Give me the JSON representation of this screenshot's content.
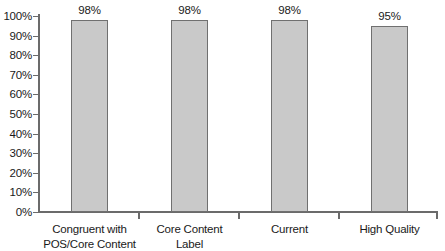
{
  "chart_data": {
    "type": "bar",
    "title": "",
    "subtitle": "",
    "xlabel": "",
    "ylabel": "",
    "categories": [
      "Congruent with POS/Core Content",
      "Core Content Label",
      "Current",
      "High Quality"
    ],
    "category_lines": [
      [
        "Congruent with",
        "POS/Core Content"
      ],
      [
        "Core Content",
        "Label"
      ],
      [
        "Current"
      ],
      [
        "High Quality"
      ]
    ],
    "values": [
      98,
      98,
      98,
      95
    ],
    "value_labels": [
      "98%",
      "98%",
      "98%",
      "95%"
    ],
    "ylim": [
      0,
      100
    ],
    "ytick_values": [
      0,
      10,
      20,
      30,
      40,
      50,
      60,
      70,
      80,
      90,
      100
    ],
    "ytick_labels": [
      "0%",
      "10%",
      "20%",
      "30%",
      "40%",
      "50%",
      "60%",
      "70%",
      "80%",
      "90%",
      "100%"
    ],
    "grid": false,
    "legend": false,
    "legend_position": "none",
    "orientation": "vertical",
    "bar_fill_color": "#c9c9c9",
    "bar_border_color": "#707070",
    "axis_color": "#6b6b6b",
    "text_color": "#1a1a1a",
    "background_color": "#ffffff"
  }
}
